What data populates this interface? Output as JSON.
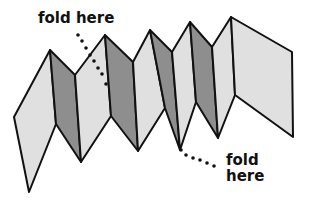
{
  "diagram": {
    "labels": {
      "top": "fold here",
      "bottom_line1": "fold",
      "bottom_line2": "here"
    },
    "colors": {
      "light_panel": "#e0e0e0",
      "dark_panel": "#8e8e8e",
      "outline": "#111111",
      "background": "#ffffff"
    },
    "panels": [
      {
        "shade": "light",
        "points": "14,117 50,50 56,124 29,192"
      },
      {
        "shade": "dark",
        "points": "50,50 75,75 81,162 56,124"
      },
      {
        "shade": "light",
        "points": "75,75 105,35 111,116 81,162"
      },
      {
        "shade": "dark",
        "points": "105,35 133,62 138,151 111,116"
      },
      {
        "shade": "light",
        "points": "133,62 150,30 165,108 138,151"
      },
      {
        "shade": "dark",
        "points": "150,30 172,52 180,150 165,108"
      },
      {
        "shade": "light",
        "points": "172,52 190,22 196,102 180,150"
      },
      {
        "shade": "dark",
        "points": "190,22 212,47 218,138 196,102"
      },
      {
        "shade": "light",
        "points": "212,47 231,17 235,95 218,138"
      },
      {
        "shade": "light",
        "points": "231,17 292,52 293,137 235,95"
      }
    ],
    "dotted_leaders": {
      "top": [
        [
          78,
          35
        ],
        [
          82,
          41
        ],
        [
          86,
          48
        ],
        [
          90,
          55
        ],
        [
          94,
          61
        ],
        [
          98,
          68
        ],
        [
          102,
          74
        ],
        [
          106,
          84
        ]
      ],
      "bottom": [
        [
          181,
          150
        ],
        [
          186,
          155
        ],
        [
          193,
          158
        ],
        [
          200,
          160
        ],
        [
          207,
          163
        ],
        [
          214,
          166
        ]
      ]
    }
  }
}
